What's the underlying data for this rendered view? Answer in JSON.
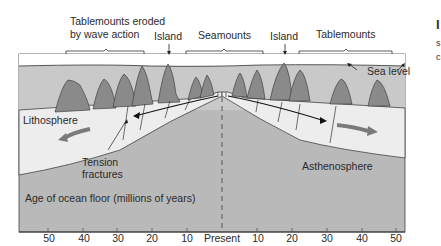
{
  "diagram": {
    "top_labels": {
      "tablemounts_eroded": "Tablemounts eroded\nby wave action",
      "tablemounts_eroded_line1": "Tablemounts eroded",
      "tablemounts_eroded_line2": "by wave action",
      "island_left": "Island",
      "seamounts": "Seamounts",
      "island_right": "Island",
      "tablemounts": "Tablemounts"
    },
    "sea_level": "Sea level",
    "lithosphere": "Lithosphere",
    "tension_fractures_line1": "Tension",
    "tension_fractures_line2": "fractures",
    "asthenosphere": "Asthenosphere",
    "axis_title": "Age of ocean floor (millions of years)",
    "axis_ticks": [
      "50",
      "40",
      "30",
      "20",
      "10",
      "Present",
      "10",
      "20",
      "30",
      "40",
      "50"
    ],
    "colors": {
      "sea": "#c9c9c9",
      "lithosphere": "#ededed",
      "asthenosphere": "#b9b9b9",
      "seamount": "#8a8a8a",
      "plate_arrow": "#7a7a7a"
    }
  },
  "right_edge_fragments": [
    "I",
    "s",
    "c"
  ]
}
